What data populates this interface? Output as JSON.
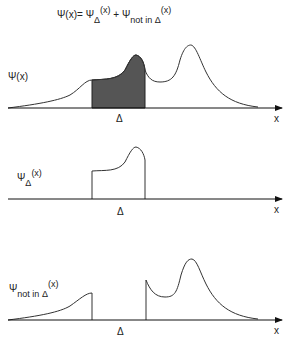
{
  "equation": {
    "lhs": "Ψ(x)=",
    "term1_symbol": "Ψ",
    "term1_sub": "Δ",
    "term1_arg": "(x)",
    "plus": "+",
    "term2_symbol": "Ψ",
    "term2_sub": "not in Δ",
    "term2_arg": "(x)"
  },
  "panels": [
    {
      "label_symbol": "Ψ(x)",
      "label_sub": "",
      "label_arg": "",
      "region_label": "Δ",
      "axis_label": "x",
      "shaded_color": "#555555"
    },
    {
      "label_symbol": "Ψ",
      "label_sub": "Δ",
      "label_arg": "(x)",
      "region_label": "Δ",
      "axis_label": "x"
    },
    {
      "label_symbol": "Ψ",
      "label_sub": "not in Δ",
      "label_arg": "(x)",
      "region_label": "Δ",
      "axis_label": "x"
    }
  ]
}
